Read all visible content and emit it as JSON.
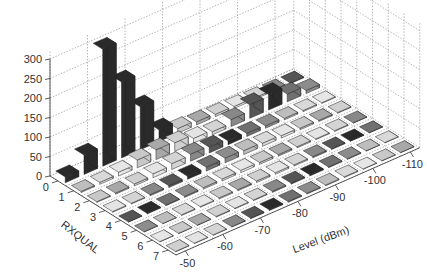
{
  "chart_data": {
    "type": "bar3d",
    "title": "",
    "xlabel": "Level (dBm)",
    "ylabel": "RXQUAL",
    "zlabel": "",
    "x_ticks": [
      "-50",
      "-60",
      "-70",
      "-80",
      "-90",
      "-100",
      "-110"
    ],
    "y_ticks": [
      "0",
      "1",
      "2",
      "3",
      "4",
      "5",
      "6",
      "7"
    ],
    "z_ticks": [
      "0",
      "50",
      "100",
      "150",
      "200",
      "250",
      "300"
    ],
    "zlim": [
      0,
      300
    ],
    "grid": true,
    "levels": [
      -50,
      -55,
      -60,
      -65,
      -70,
      -75,
      -80,
      -85,
      -90,
      -95,
      -100,
      -105,
      -110
    ],
    "rxqual": [
      0,
      1,
      2,
      3,
      4,
      5,
      6,
      7
    ],
    "values_by_rxqual": [
      [
        15,
        50,
        300,
        195,
        110,
        30,
        12,
        8,
        6,
        5,
        4,
        3,
        2
      ],
      [
        3,
        5,
        10,
        20,
        25,
        22,
        12,
        8,
        18,
        35,
        40,
        20,
        8
      ],
      [
        2,
        3,
        5,
        10,
        15,
        18,
        15,
        10,
        8,
        6,
        4,
        3,
        2
      ],
      [
        2,
        2,
        3,
        5,
        8,
        10,
        12,
        10,
        8,
        6,
        4,
        3,
        2
      ],
      [
        1,
        2,
        2,
        3,
        4,
        5,
        6,
        5,
        4,
        3,
        2,
        2,
        1
      ],
      [
        1,
        1,
        2,
        2,
        3,
        3,
        4,
        4,
        3,
        3,
        2,
        1,
        1
      ],
      [
        1,
        1,
        1,
        2,
        2,
        2,
        3,
        3,
        3,
        2,
        2,
        1,
        1
      ],
      [
        1,
        1,
        1,
        1,
        2,
        2,
        2,
        2,
        2,
        2,
        1,
        1,
        1
      ]
    ]
  }
}
